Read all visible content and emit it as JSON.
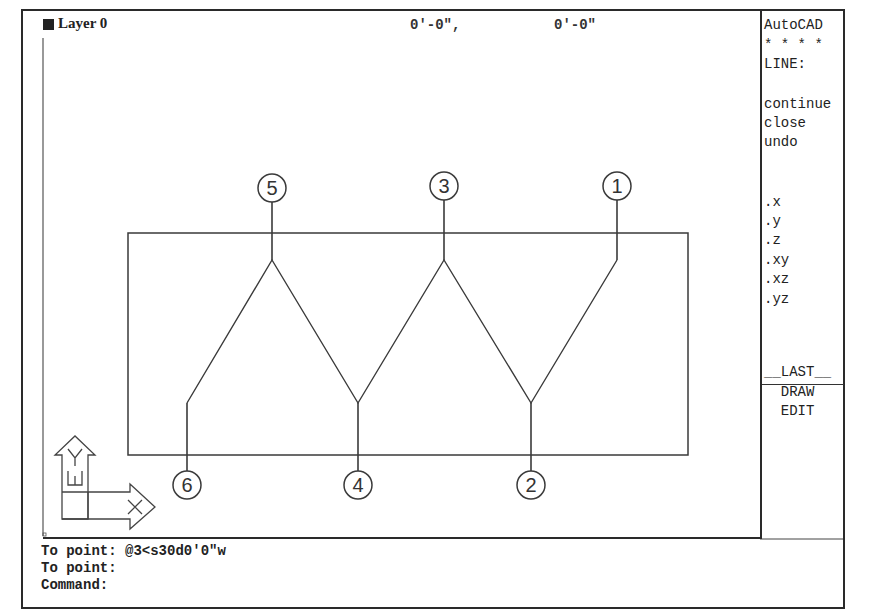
{
  "status_bar": {
    "layer_label": "Layer 0",
    "coord_x": "0'-0\",",
    "coord_y": "0'-0\""
  },
  "side_menu": {
    "items": [
      {
        "label": "AutoCAD",
        "top": 5
      },
      {
        "label": "* * * *",
        "top": 25
      },
      {
        "label": "LINE:",
        "top": 44
      },
      {
        "label": "continue",
        "top": 84
      },
      {
        "label": "close",
        "top": 103
      },
      {
        "label": "undo",
        "top": 122
      },
      {
        "label": ".x",
        "top": 182
      },
      {
        "label": ".y",
        "top": 201
      },
      {
        "label": ".z",
        "top": 220
      },
      {
        "label": ".xy",
        "top": 240
      },
      {
        "label": ".xz",
        "top": 259
      },
      {
        "label": ".yz",
        "top": 279
      },
      {
        "label": "__LAST__",
        "top": 352
      },
      {
        "label": "  DRAW",
        "top": 372
      },
      {
        "label": "  EDIT",
        "top": 391
      }
    ]
  },
  "drawing": {
    "rectangle": {
      "x": 128,
      "y": 233,
      "w": 560,
      "h": 222
    },
    "points": [
      {
        "label": "1",
        "x": 617,
        "y": 260,
        "circle_y": 186
      },
      {
        "label": "2",
        "x": 531,
        "y": 403,
        "circle_y": 485
      },
      {
        "label": "3",
        "x": 444,
        "y": 260,
        "circle_y": 186
      },
      {
        "label": "4",
        "x": 358,
        "y": 403,
        "circle_y": 485
      },
      {
        "label": "5",
        "x": 272,
        "y": 260,
        "circle_y": 188
      },
      {
        "label": "6",
        "x": 187,
        "y": 403,
        "circle_y": 485
      }
    ],
    "ucs_icon": {
      "y_label": "Y",
      "w_label": "W",
      "x_label": "X"
    }
  },
  "command_history": [
    "To point: @3<s30d0'0\"w",
    "To point:",
    "Command:"
  ],
  "colors": {
    "line": "#3a3a3a",
    "frame": "#2a2a2a",
    "background": "#ffffff"
  }
}
